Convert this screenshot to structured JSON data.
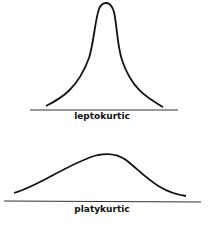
{
  "diagrams": [
    {
      "id": "leptokurtic",
      "label": "leptokurtic"
    },
    {
      "id": "platykurtic",
      "label": "platykurtic"
    }
  ],
  "colors": {
    "stroke": "#111111",
    "background": "#ffffff"
  }
}
